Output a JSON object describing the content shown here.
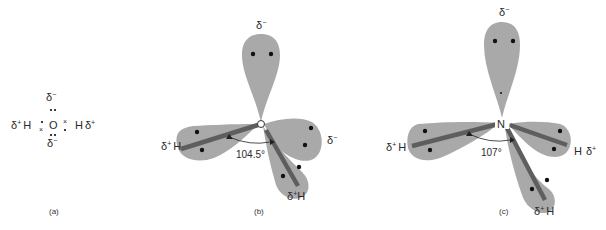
{
  "figure": {
    "panels": [
      {
        "id": "a",
        "caption": "(a)",
        "description": "Lewis electron-dot structure of water",
        "central_atom": "O",
        "labels": {
          "top": "δ",
          "top_sup": "−",
          "bottom": "δ",
          "bottom_sup": "−",
          "left_charge": "δ",
          "left_sup": "+",
          "left_atom": "H",
          "right_atom": "H",
          "right_charge": "δ",
          "right_sup": "+"
        }
      },
      {
        "id": "b",
        "caption": "(b)",
        "description": "Tetrahedral orbital model of water (H2O)",
        "central_atom": "O",
        "bond_angle": "104.5°",
        "labels": {
          "top": "δ",
          "top_sup": "−",
          "right": "δ",
          "right_sup": "−",
          "left_charge": "δ",
          "left_sup": "+",
          "left_atom": "H",
          "bottom_charge": "δ",
          "bottom_sup": "+",
          "bottom_atom": "H"
        }
      },
      {
        "id": "c",
        "caption": "(c)",
        "description": "Tetrahedral orbital model of ammonia (NH3)",
        "central_atom": "N",
        "bond_angle": "107°",
        "labels": {
          "top": "δ",
          "top_sup": "−",
          "left_charge": "δ",
          "left_sup": "+",
          "left_atom": "H",
          "right_atom": "H",
          "right_charge": "δ",
          "right_sup": "+",
          "bottom_charge": "δ",
          "bottom_sup": "+",
          "bottom_atom": "H"
        }
      }
    ],
    "colors": {
      "orbital_lobe": "#a9a9a9",
      "bond": "#5e5e5e",
      "electron": "#111111",
      "text": "#2a2a2a"
    }
  }
}
